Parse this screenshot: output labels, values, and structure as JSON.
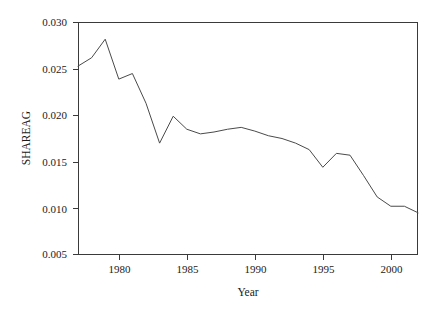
{
  "chart_data": {
    "type": "line",
    "title": "",
    "xlabel": "Year",
    "ylabel": "SHAREAG",
    "xlim": [
      1977,
      2002
    ],
    "ylim": [
      0.005,
      0.03
    ],
    "grid": false,
    "legend": null,
    "xticks": [
      1980,
      1985,
      1990,
      1995,
      2000
    ],
    "xtick_labels": [
      "1980",
      "1985",
      "1990",
      "1995",
      "2000"
    ],
    "yticks": [
      0.005,
      0.01,
      0.015,
      0.02,
      0.025,
      0.03
    ],
    "ytick_labels": [
      "0.005",
      "0.010",
      "0.015",
      "0.020",
      "0.025",
      "0.030"
    ],
    "line_color": "#4a4a4a",
    "x": [
      1977,
      1978,
      1979,
      1980,
      1981,
      1982,
      1983,
      1984,
      1985,
      1986,
      1987,
      1988,
      1989,
      1990,
      1991,
      1992,
      1993,
      1994,
      1995,
      1996,
      1997,
      1998,
      1999,
      2000,
      2001,
      2002
    ],
    "values": [
      0.0253,
      0.0262,
      0.0282,
      0.0239,
      0.0245,
      0.0213,
      0.017,
      0.0199,
      0.0185,
      0.018,
      0.0182,
      0.0185,
      0.0187,
      0.0183,
      0.0178,
      0.0175,
      0.017,
      0.0163,
      0.0144,
      0.0159,
      0.0157,
      0.0135,
      0.0112,
      0.0102,
      0.0102,
      0.0095
    ],
    "series": [
      {
        "name": "SHAREAG",
        "values": [
          0.0253,
          0.0262,
          0.0282,
          0.0239,
          0.0245,
          0.0213,
          0.017,
          0.0199,
          0.0185,
          0.018,
          0.0182,
          0.0185,
          0.0187,
          0.0183,
          0.0178,
          0.0175,
          0.017,
          0.0163,
          0.0144,
          0.0159,
          0.0157,
          0.0135,
          0.0112,
          0.0102,
          0.0102,
          0.0095
        ]
      }
    ]
  }
}
